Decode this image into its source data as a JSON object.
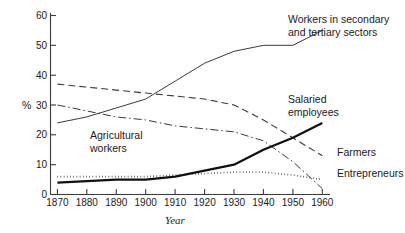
{
  "chart_data": {
    "type": "line",
    "title": "",
    "xlabel": "Year",
    "ylabel": "%",
    "xlim": [
      1870,
      1960
    ],
    "ylim": [
      0,
      60
    ],
    "grid": false,
    "legend_position": "inline-annotations",
    "x_ticks": [
      "1870",
      "1880",
      "1890",
      "1900",
      "1910",
      "1920",
      "1930",
      "1940",
      "1950",
      "1960"
    ],
    "y_ticks": [
      "0",
      "10",
      "20",
      "30",
      "40",
      "50",
      "60"
    ],
    "x": [
      1870,
      1880,
      1890,
      1900,
      1910,
      1920,
      1930,
      1940,
      1950,
      1960
    ],
    "series": [
      {
        "name": "Workers in secondary and tertiary sectors",
        "style": "solid-thin",
        "values": [
          24,
          26,
          29,
          32,
          38,
          44,
          48,
          50,
          50,
          55
        ],
        "label": "Workers in secondary\nand tertiary sectors",
        "label_line1": "Workers in secondary",
        "label_line2": "and tertiary sectors"
      },
      {
        "name": "Farmers",
        "style": "dashed",
        "values": [
          37,
          36,
          35,
          34,
          33,
          32,
          30,
          25,
          19,
          13
        ],
        "label": "Farmers"
      },
      {
        "name": "Agricultural workers",
        "style": "dash-dot",
        "values": [
          30,
          28,
          26,
          25,
          23,
          22,
          21,
          18,
          11,
          2
        ],
        "label_line1": "Agricultural",
        "label_line2": "workers",
        "label": "Agricultural workers"
      },
      {
        "name": "Salaried employees",
        "style": "solid-thick",
        "values": [
          4,
          4.5,
          5,
          5,
          6,
          8,
          10,
          15,
          19,
          24
        ],
        "label_line1": "Salaried",
        "label_line2": "employees",
        "label": "Salaried employees"
      },
      {
        "name": "Entrepreneurs",
        "style": "dotted",
        "values": [
          6,
          6,
          6,
          6,
          6.5,
          7,
          7.5,
          7.5,
          6.5,
          5
        ],
        "label": "Entrepreneurs"
      }
    ]
  },
  "colors": {
    "axis": "#3a3a3a",
    "ink": "#1a1a1a",
    "background": "#ffffff"
  }
}
